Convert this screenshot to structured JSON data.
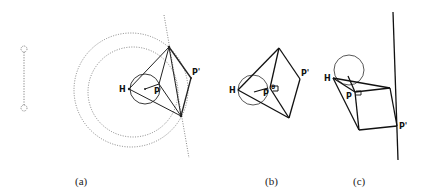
{
  "figure": {
    "panels": [
      {
        "id": "a",
        "caption": "(a)",
        "labels": {
          "H": "H",
          "P": "P",
          "P_prime": "P'"
        }
      },
      {
        "id": "b",
        "caption": "(b)",
        "labels": {
          "H": "H",
          "P": "P",
          "P_prime": "P'",
          "angle": "θ"
        }
      },
      {
        "id": "c",
        "caption": "(c)",
        "labels": {
          "H": "H",
          "P": "P",
          "P_prime": "P'"
        }
      }
    ]
  }
}
